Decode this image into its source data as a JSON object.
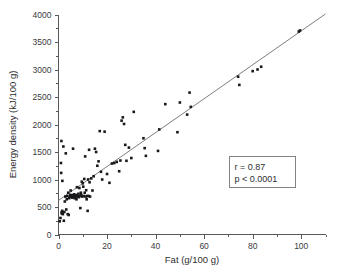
{
  "chart_data": {
    "type": "scatter",
    "title": "",
    "xlabel": "Fat (g/100 g)",
    "ylabel": "Energy density (kJ/100 g)",
    "xlim": [
      0,
      110
    ],
    "ylim": [
      0,
      4000
    ],
    "grid": false,
    "legend": null,
    "x_ticks": [
      0,
      20,
      40,
      60,
      80,
      100
    ],
    "x_tick_labels": [
      "0",
      "20",
      "40",
      "60",
      "80",
      "100"
    ],
    "x_minor_ticks": [
      10,
      30,
      50,
      70,
      90,
      110
    ],
    "y_ticks": [
      0,
      500,
      1000,
      1500,
      2000,
      2500,
      3000,
      3500,
      4000
    ],
    "y_tick_labels": [
      "0",
      "500",
      "1000",
      "1500",
      "2000",
      "2500",
      "3000",
      "3500",
      "4000"
    ],
    "y_minor_ticks": [
      250,
      750,
      1250,
      1750,
      2250,
      2750,
      3250,
      3750
    ],
    "marker": "filled-square",
    "marker_color": "#19191b",
    "fit_line": {
      "type": "linear-regression",
      "x_start": 0,
      "y_start": 620,
      "x_end": 110,
      "y_end": 4010,
      "color": "#6d6e71"
    },
    "annotations": {
      "stats_box": {
        "r_label": "r = 0.87",
        "p_label": "p < 0.0001"
      }
    },
    "points": [
      [
        0.5,
        240
      ],
      [
        0.8,
        300
      ],
      [
        1.0,
        1300
      ],
      [
        1.1,
        1120
      ],
      [
        1.2,
        1700
      ],
      [
        1.3,
        400
      ],
      [
        1.4,
        380
      ],
      [
        1.5,
        430
      ],
      [
        1.6,
        975
      ],
      [
        1.8,
        370
      ],
      [
        2.0,
        1600
      ],
      [
        2.2,
        250
      ],
      [
        2.4,
        410
      ],
      [
        2.6,
        600
      ],
      [
        2.8,
        690
      ],
      [
        3.0,
        1475
      ],
      [
        3.2,
        455
      ],
      [
        3.4,
        640
      ],
      [
        3.6,
        700
      ],
      [
        3.8,
        370
      ],
      [
        4.0,
        760
      ],
      [
        4.2,
        355
      ],
      [
        4.4,
        660
      ],
      [
        4.6,
        690
      ],
      [
        4.8,
        720
      ],
      [
        5.0,
        800
      ],
      [
        5.2,
        690
      ],
      [
        5.4,
        715
      ],
      [
        5.6,
        670
      ],
      [
        5.8,
        700
      ],
      [
        6.0,
        1560
      ],
      [
        6.2,
        690
      ],
      [
        6.4,
        730
      ],
      [
        6.6,
        660
      ],
      [
        6.8,
        700
      ],
      [
        7.0,
        690
      ],
      [
        7.2,
        720
      ],
      [
        7.4,
        640
      ],
      [
        7.6,
        860
      ],
      [
        7.8,
        690
      ],
      [
        8.0,
        700
      ],
      [
        8.2,
        740
      ],
      [
        8.4,
        680
      ],
      [
        8.6,
        845
      ],
      [
        8.8,
        700
      ],
      [
        9.0,
        480
      ],
      [
        9.2,
        760
      ],
      [
        9.4,
        720
      ],
      [
        9.6,
        960
      ],
      [
        9.8,
        690
      ],
      [
        10.0,
        930
      ],
      [
        10.2,
        870
      ],
      [
        10.4,
        700
      ],
      [
        10.6,
        1010
      ],
      [
        10.8,
        760
      ],
      [
        11.0,
        1420
      ],
      [
        11.2,
        690
      ],
      [
        11.4,
        805
      ],
      [
        11.6,
        640
      ],
      [
        11.8,
        700
      ],
      [
        12.0,
        430
      ],
      [
        12.2,
        1000
      ],
      [
        12.4,
        700
      ],
      [
        12.6,
        1540
      ],
      [
        12.8,
        950
      ],
      [
        13.0,
        690
      ],
      [
        13.5,
        1020
      ],
      [
        14.0,
        800
      ],
      [
        14.5,
        1060
      ],
      [
        15.0,
        1560
      ],
      [
        15.5,
        1500
      ],
      [
        16.0,
        1250
      ],
      [
        16.5,
        1330
      ],
      [
        17.0,
        1880
      ],
      [
        17.5,
        1140
      ],
      [
        18.0,
        1000
      ],
      [
        19.0,
        1870
      ],
      [
        20.0,
        1100
      ],
      [
        21.0,
        940
      ],
      [
        22.0,
        1290
      ],
      [
        23.0,
        1300
      ],
      [
        24.0,
        1320
      ],
      [
        25.0,
        1150
      ],
      [
        25.5,
        1345
      ],
      [
        26.0,
        2070
      ],
      [
        26.5,
        2130
      ],
      [
        27.0,
        2010
      ],
      [
        27.5,
        1630
      ],
      [
        28.0,
        1340
      ],
      [
        29.0,
        1580
      ],
      [
        30.0,
        1390
      ],
      [
        31.0,
        2230
      ],
      [
        35.0,
        1750
      ],
      [
        35.5,
        1570
      ],
      [
        36.0,
        1430
      ],
      [
        41.0,
        1520
      ],
      [
        41.5,
        1910
      ],
      [
        44.0,
        2370
      ],
      [
        49.0,
        1860
      ],
      [
        50.0,
        2400
      ],
      [
        53.0,
        2180
      ],
      [
        54.0,
        2580
      ],
      [
        54.5,
        2320
      ],
      [
        74.0,
        2870
      ],
      [
        74.5,
        2720
      ],
      [
        80.0,
        2970
      ],
      [
        82.0,
        3000
      ],
      [
        83.5,
        3050
      ],
      [
        99.0,
        3690
      ],
      [
        99.5,
        3710
      ]
    ]
  }
}
